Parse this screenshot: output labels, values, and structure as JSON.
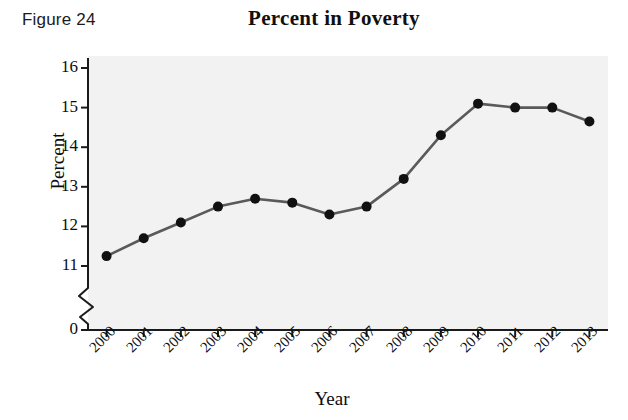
{
  "figure": {
    "label": "Figure 24"
  },
  "chart_data": {
    "type": "line",
    "title": "Percent in Poverty",
    "xlabel": "Year",
    "ylabel": "Percent",
    "categories": [
      "2000",
      "2001",
      "2002",
      "2003",
      "2004",
      "2005",
      "2006",
      "2007",
      "2008",
      "2009",
      "2010",
      "2011",
      "2012",
      "2013"
    ],
    "values": [
      11.25,
      11.7,
      12.1,
      12.5,
      12.7,
      12.6,
      12.3,
      12.5,
      13.2,
      14.3,
      15.1,
      15.0,
      15.0,
      14.65
    ],
    "x": [
      2000,
      2001,
      2002,
      2003,
      2004,
      2005,
      2006,
      2007,
      2008,
      2009,
      2010,
      2011,
      2012,
      2013
    ],
    "series": [
      {
        "name": "Percent in Poverty",
        "values": [
          11.25,
          11.7,
          12.1,
          12.5,
          12.7,
          12.6,
          12.3,
          12.5,
          13.2,
          14.3,
          15.1,
          15.0,
          15.0,
          14.65
        ]
      }
    ],
    "ytick_labels": [
      "16",
      "15",
      "14",
      "13",
      "12",
      "11",
      "0"
    ],
    "ytick_values": [
      16,
      15,
      14,
      13,
      12,
      11,
      0
    ],
    "ylim": [
      10.6,
      16.3
    ],
    "y_axis_break": true,
    "y_axis_break_between": [
      0,
      11
    ],
    "grid": false,
    "legend": false,
    "marker": "filled-circle",
    "line_color": "#5a5a5a",
    "marker_color": "#111111",
    "plot_background": "#f2f2f2"
  }
}
